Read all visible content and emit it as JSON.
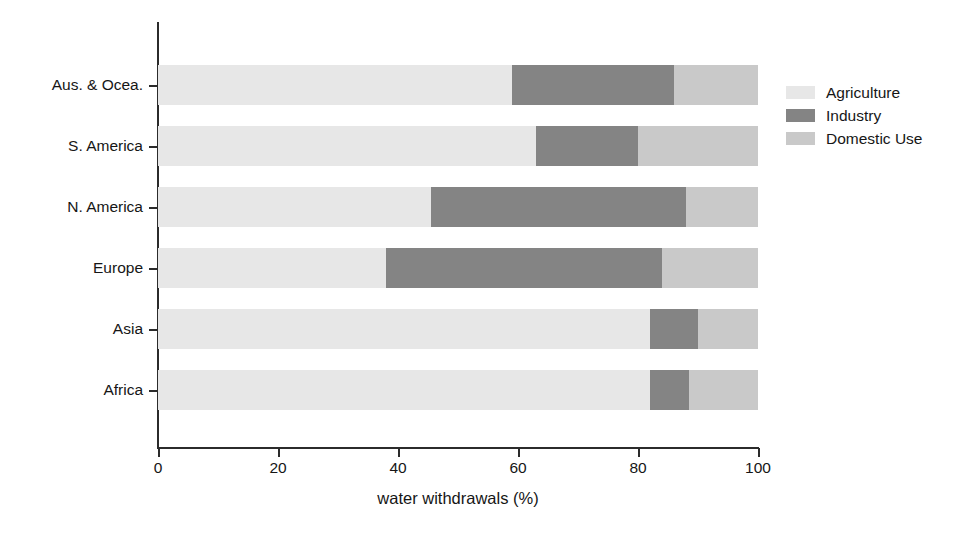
{
  "chart_data": {
    "type": "bar",
    "orientation": "horizontal",
    "stacked": true,
    "stack_total": 100,
    "title": "",
    "xlabel": "water withdrawals (%)",
    "ylabel": "",
    "xlim": [
      0,
      100
    ],
    "xticks": [
      "0",
      "20",
      "40",
      "60",
      "80",
      "100"
    ],
    "xtick_values": [
      0,
      20,
      40,
      60,
      80,
      100
    ],
    "grid": false,
    "legend_position": "right",
    "categories": [
      "Africa",
      "Asia",
      "Europe",
      "N. America",
      "S. America",
      "Aus. & Ocea."
    ],
    "series": [
      {
        "name": "Agriculture",
        "color": "#e7e7e7",
        "values": [
          82,
          82,
          38,
          45.5,
          63,
          59
        ]
      },
      {
        "name": "Industry",
        "color": "#848484",
        "values": [
          6.5,
          8,
          46,
          42.5,
          17,
          27
        ]
      },
      {
        "name": "Domestic Use",
        "color": "#c9c9c9",
        "values": [
          11.5,
          10,
          16,
          12,
          20,
          14
        ]
      }
    ]
  },
  "axis": {
    "x_title": "water withdrawals (%)",
    "x_ticks": [
      {
        "label": "0",
        "value": 0
      },
      {
        "label": "20",
        "value": 20
      },
      {
        "label": "40",
        "value": 40
      },
      {
        "label": "60",
        "value": 60
      },
      {
        "label": "80",
        "value": 80
      },
      {
        "label": "100",
        "value": 100
      }
    ],
    "y_ticks": [
      {
        "label": "Aus. & Ocea."
      },
      {
        "label": "S. America"
      },
      {
        "label": "N. America"
      },
      {
        "label": "Europe"
      },
      {
        "label": "Asia"
      },
      {
        "label": "Africa"
      }
    ]
  },
  "legend": {
    "items": [
      {
        "label": "Agriculture",
        "color": "#e7e7e7",
        "swatch": "agriculture-swatch"
      },
      {
        "label": "Industry",
        "color": "#848484",
        "swatch": "industry-swatch"
      },
      {
        "label": "Domestic Use",
        "color": "#c9c9c9",
        "swatch": "domestic-use-swatch"
      }
    ]
  },
  "rows": [
    {
      "label": "Aus. & Ocea.",
      "agriculture": 59,
      "industry": 27,
      "domestic": 14
    },
    {
      "label": "S. America",
      "agriculture": 63,
      "industry": 17,
      "domestic": 20
    },
    {
      "label": "N. America",
      "agriculture": 45.5,
      "industry": 42.5,
      "domestic": 12
    },
    {
      "label": "Europe",
      "agriculture": 38,
      "industry": 46,
      "domestic": 16
    },
    {
      "label": "Asia",
      "agriculture": 82,
      "industry": 8,
      "domestic": 10
    },
    {
      "label": "Africa",
      "agriculture": 82,
      "industry": 6.5,
      "domestic": 11.5
    }
  ]
}
